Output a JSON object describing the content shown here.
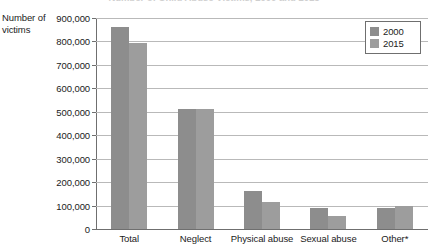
{
  "chart_data": {
    "type": "bar",
    "title": "Number of Child Abuse Victims, 2000 and 2015",
    "xlabel": "",
    "ylabel": "Number of victims",
    "ylim": [
      0,
      900000
    ],
    "ytick_step": 100000,
    "grid": true,
    "legend_position": "top-right",
    "categories": [
      "Total",
      "Neglect",
      "Physical abuse",
      "Sexual abuse",
      "Other*"
    ],
    "ytick_labels": [
      "900,000",
      "800,000",
      "700,000",
      "600,000",
      "500,000",
      "400,000",
      "300,000",
      "200,000",
      "100,000",
      "0"
    ],
    "ytick_values": [
      900000,
      800000,
      700000,
      600000,
      500000,
      400000,
      300000,
      200000,
      100000,
      0
    ],
    "series": [
      {
        "name": "2000",
        "color": "#8d8d8d",
        "values": [
          862000,
          511000,
          161000,
          88000,
          91000
        ]
      },
      {
        "name": "2015",
        "color": "#9d9d9d",
        "values": [
          792000,
          513000,
          115000,
          57000,
          99000
        ]
      }
    ],
    "footnote": "Other*"
  },
  "axis": {
    "y_title_line1": "Number of",
    "y_title_line2": "victims"
  },
  "legend": {
    "entries": [
      {
        "label": "2000",
        "color": "#8d8d8d"
      },
      {
        "label": "2015",
        "color": "#9d9d9d"
      }
    ]
  },
  "colors": {
    "series_2000": "#8d8d8d",
    "series_2015": "#9d9d9d",
    "gridline": "#b9b9b9",
    "axis": "#6f6f6f",
    "text": "#1b1b1b",
    "background": "#ffffff"
  }
}
